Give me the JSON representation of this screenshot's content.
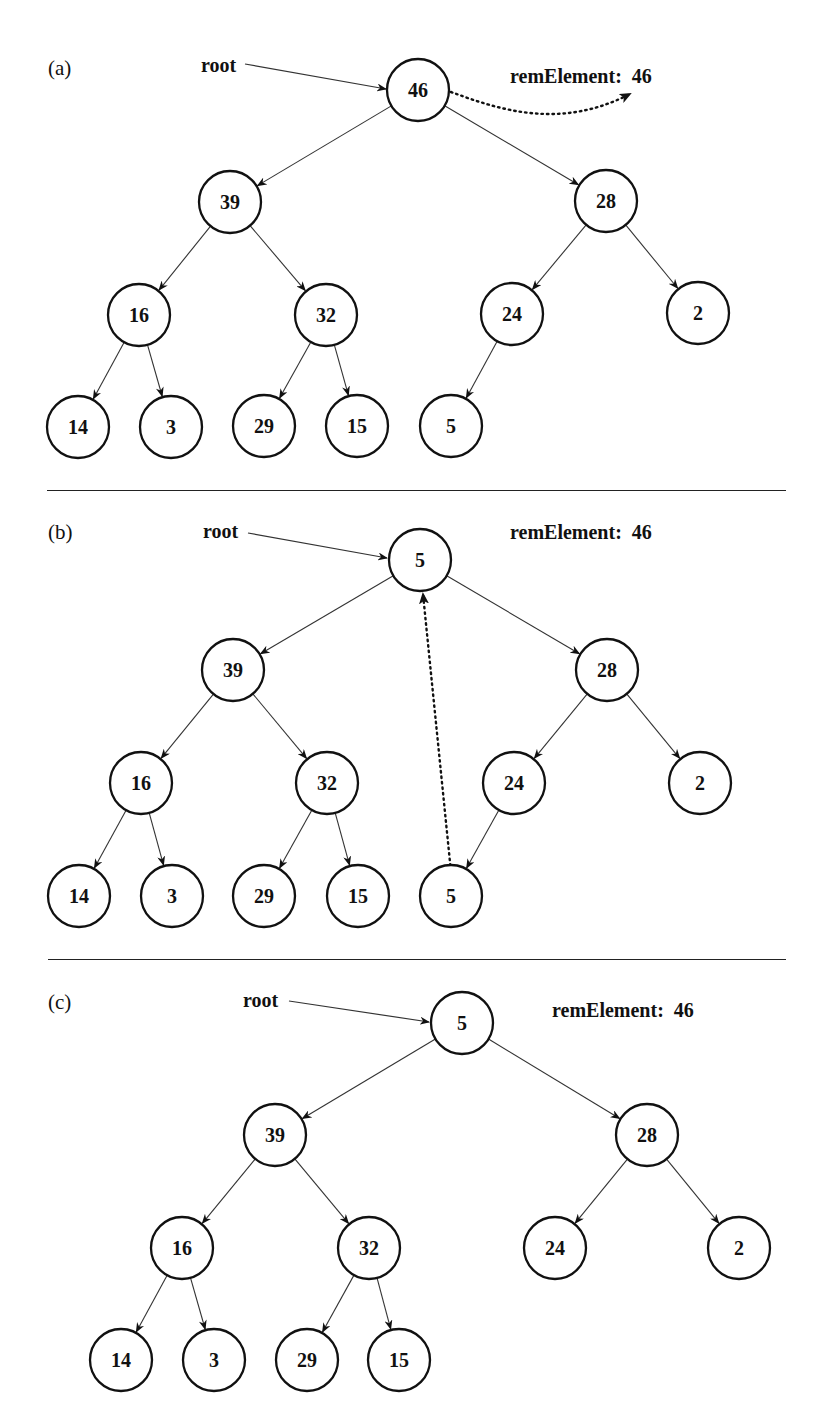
{
  "figure": {
    "separators": [
      {
        "y": 490,
        "x1": 47,
        "x2": 786
      },
      {
        "y": 959,
        "x1": 48,
        "x2": 786
      }
    ],
    "panels": [
      {
        "label": "(a)",
        "label_pos": {
          "x": 48,
          "y": 58
        },
        "root_label": "root",
        "root_label_pos": {
          "x": 201,
          "y": 55
        },
        "root_arrow": {
          "x1": 245,
          "y1": 64,
          "x2": 386,
          "y2": 89
        },
        "rem_label": "remElement:",
        "rem_value": "46",
        "rem_pos": {
          "x": 510,
          "y": 66
        },
        "nodes": [
          {
            "id": "root",
            "value": "46",
            "x": 418,
            "y": 90
          },
          {
            "id": "l",
            "value": "39",
            "x": 230,
            "y": 202
          },
          {
            "id": "r",
            "value": "28",
            "x": 606,
            "y": 201
          },
          {
            "id": "ll",
            "value": "16",
            "x": 139,
            "y": 315
          },
          {
            "id": "lr",
            "value": "32",
            "x": 326,
            "y": 315
          },
          {
            "id": "rl",
            "value": "24",
            "x": 512,
            "y": 314
          },
          {
            "id": "rr",
            "value": "2",
            "x": 698,
            "y": 313
          },
          {
            "id": "lll",
            "value": "14",
            "x": 78,
            "y": 427
          },
          {
            "id": "llr",
            "value": "3",
            "x": 171,
            "y": 427
          },
          {
            "id": "lrl",
            "value": "29",
            "x": 264,
            "y": 426
          },
          {
            "id": "lrr",
            "value": "15",
            "x": 357,
            "y": 426
          },
          {
            "id": "rll",
            "value": "5",
            "x": 451,
            "y": 426
          }
        ],
        "edges": [
          [
            "root",
            "l"
          ],
          [
            "root",
            "r"
          ],
          [
            "l",
            "ll"
          ],
          [
            "l",
            "lr"
          ],
          [
            "r",
            "rl"
          ],
          [
            "r",
            "rr"
          ],
          [
            "ll",
            "lll"
          ],
          [
            "ll",
            "llr"
          ],
          [
            "lr",
            "lrl"
          ],
          [
            "lr",
            "lrr"
          ],
          [
            "rl",
            "rll"
          ]
        ],
        "dotted_arrow": {
          "type": "curve",
          "path": "M 451 92 C 500 110, 560 130, 630 94",
          "meaning": "root value copied to remElement"
        }
      },
      {
        "label": "(b)",
        "label_pos": {
          "x": 48,
          "y": 522
        },
        "root_label": "root",
        "root_label_pos": {
          "x": 203,
          "y": 521
        },
        "root_arrow": {
          "x1": 248,
          "y1": 533,
          "x2": 387,
          "y2": 558
        },
        "rem_label": "remElement:",
        "rem_value": "46",
        "rem_pos": {
          "x": 510,
          "y": 522
        },
        "nodes": [
          {
            "id": "root",
            "value": "5",
            "x": 420,
            "y": 560
          },
          {
            "id": "l",
            "value": "39",
            "x": 233,
            "y": 670
          },
          {
            "id": "r",
            "value": "28",
            "x": 607,
            "y": 670
          },
          {
            "id": "ll",
            "value": "16",
            "x": 141,
            "y": 783
          },
          {
            "id": "lr",
            "value": "32",
            "x": 327,
            "y": 783
          },
          {
            "id": "rl",
            "value": "24",
            "x": 514,
            "y": 783
          },
          {
            "id": "rr",
            "value": "2",
            "x": 700,
            "y": 783
          },
          {
            "id": "lll",
            "value": "14",
            "x": 79,
            "y": 896
          },
          {
            "id": "llr",
            "value": "3",
            "x": 172,
            "y": 896
          },
          {
            "id": "lrl",
            "value": "29",
            "x": 264,
            "y": 896
          },
          {
            "id": "lrr",
            "value": "15",
            "x": 358,
            "y": 896
          },
          {
            "id": "rll",
            "value": "5",
            "x": 451,
            "y": 896
          }
        ],
        "edges": [
          [
            "root",
            "l"
          ],
          [
            "root",
            "r"
          ],
          [
            "l",
            "ll"
          ],
          [
            "l",
            "lr"
          ],
          [
            "r",
            "rl"
          ],
          [
            "r",
            "rr"
          ],
          [
            "ll",
            "lll"
          ],
          [
            "ll",
            "llr"
          ],
          [
            "lr",
            "lrl"
          ],
          [
            "lr",
            "lrr"
          ],
          [
            "rl",
            "rll"
          ]
        ],
        "dotted_arrow": {
          "type": "line",
          "path": "M 452 882 L 423 594",
          "meaning": "last leaf moved to root"
        }
      },
      {
        "label": "(c)",
        "label_pos": {
          "x": 48,
          "y": 992
        },
        "root_label": "root",
        "root_label_pos": {
          "x": 243,
          "y": 990
        },
        "root_arrow": {
          "x1": 289,
          "y1": 1001,
          "x2": 429,
          "y2": 1022
        },
        "rem_label": "remElement:",
        "rem_value": "46",
        "rem_pos": {
          "x": 552,
          "y": 1000
        },
        "nodes": [
          {
            "id": "root",
            "value": "5",
            "x": 462,
            "y": 1023
          },
          {
            "id": "l",
            "value": "39",
            "x": 275,
            "y": 1135
          },
          {
            "id": "r",
            "value": "28",
            "x": 647,
            "y": 1135
          },
          {
            "id": "ll",
            "value": "16",
            "x": 182,
            "y": 1248
          },
          {
            "id": "lr",
            "value": "32",
            "x": 369,
            "y": 1248
          },
          {
            "id": "rl",
            "value": "24",
            "x": 555,
            "y": 1248
          },
          {
            "id": "rr",
            "value": "2",
            "x": 739,
            "y": 1248
          },
          {
            "id": "lll",
            "value": "14",
            "x": 121,
            "y": 1360
          },
          {
            "id": "llr",
            "value": "3",
            "x": 214,
            "y": 1360
          },
          {
            "id": "lrl",
            "value": "29",
            "x": 307,
            "y": 1360
          },
          {
            "id": "lrr",
            "value": "15",
            "x": 399,
            "y": 1360
          }
        ],
        "edges": [
          [
            "root",
            "l"
          ],
          [
            "root",
            "r"
          ],
          [
            "l",
            "ll"
          ],
          [
            "l",
            "lr"
          ],
          [
            "r",
            "rl"
          ],
          [
            "r",
            "rr"
          ],
          [
            "ll",
            "lll"
          ],
          [
            "ll",
            "llr"
          ],
          [
            "lr",
            "lrl"
          ],
          [
            "lr",
            "lrr"
          ]
        ],
        "dotted_arrow": null
      }
    ],
    "node_radius": 31,
    "colors": {
      "stroke": "#111111",
      "edge": "#333333",
      "background": "#ffffff"
    }
  }
}
